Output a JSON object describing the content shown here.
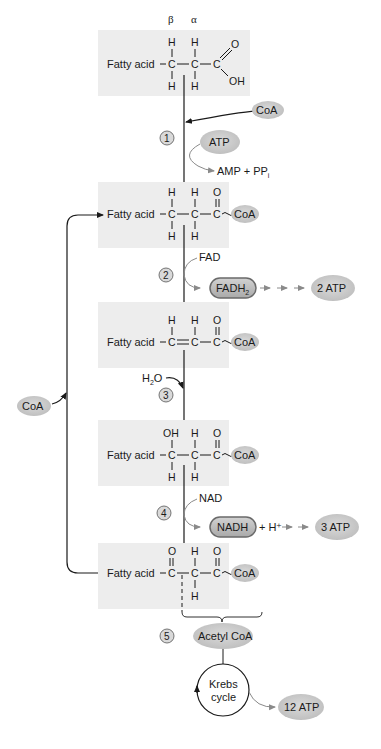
{
  "figure": {
    "colors": {
      "box_fill": "#ededed",
      "ellipse_fill": "#c9c9c9",
      "pill_fill": "#b5b5b5",
      "pill_stroke": "#6a6a6a",
      "line": "#1a1a1a",
      "grey_arrow": "#8a8a8a",
      "step_circle_fill": "#d9d9d9"
    },
    "greek": {
      "beta": "β",
      "alpha": "α"
    },
    "molecules": [
      {
        "id": "fatty-acid",
        "chain": "Fatty acid",
        "top": [
          "H",
          "H",
          "O"
        ],
        "bottom": [
          "H",
          "H",
          "OH"
        ],
        "center": [
          "C",
          "C",
          "C"
        ]
      },
      {
        "id": "acyl-coa",
        "chain": "Fatty acid",
        "top": [
          "H",
          "H",
          "O"
        ],
        "bottom": [
          "H",
          "H"
        ],
        "center": [
          "C",
          "C",
          "C"
        ],
        "tail": "CoA"
      },
      {
        "id": "trans-enoyl-coa",
        "chain": "Fatty acid",
        "top": [
          "H",
          "H",
          "O"
        ],
        "center": [
          "C",
          "C",
          "C"
        ],
        "tail": "CoA"
      },
      {
        "id": "hydroxyacyl-coa",
        "chain": "Fatty acid",
        "top": [
          "OH",
          "H",
          "O"
        ],
        "bottom": [
          "H",
          "H"
        ],
        "center": [
          "C",
          "C",
          "C"
        ],
        "tail": "CoA"
      },
      {
        "id": "ketoacyl-coa",
        "chain": "Fatty acid",
        "top": [
          "O",
          "H",
          "O"
        ],
        "bottom": [
          "H"
        ],
        "center": [
          "C",
          "C",
          "C"
        ],
        "tail": "CoA"
      }
    ],
    "steps": [
      "1",
      "2",
      "3",
      "4",
      "5"
    ],
    "step1": {
      "input": "CoA",
      "energy": "ATP",
      "output_main": "AMP + PP",
      "output_sub": "i"
    },
    "step2": {
      "input": "FAD",
      "product_main": "FADH",
      "product_sub": "2",
      "yield": "2 ATP"
    },
    "step3": {
      "input_main": "H",
      "input_sub": "2",
      "input_tail": "O"
    },
    "step4": {
      "input": "NAD",
      "product": "NADH",
      "extra": "+ H⁺",
      "yield": "3 ATP"
    },
    "step5": {
      "product": "Acetyl CoA",
      "cycle_line1": "Krebs",
      "cycle_line2": "cycle",
      "yield": "12 ATP"
    },
    "recycle": {
      "label": "CoA"
    }
  }
}
